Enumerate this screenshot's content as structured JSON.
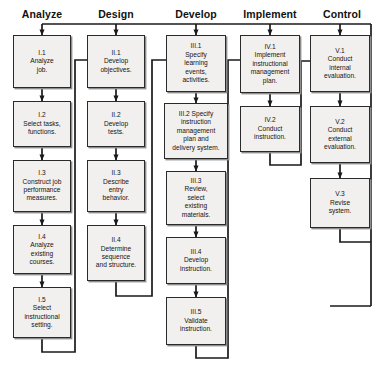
{
  "diagram": {
    "type": "flowchart",
    "orientation": "columns-top-to-bottom",
    "colors": {
      "box_fill": "#f1f0ee",
      "box_border": "#2a2a2a",
      "box_shadow": "#8e8e8e",
      "line": "#1a1a1a",
      "text": "#141414",
      "background": "#ffffff"
    },
    "phases": [
      {
        "id": "phase-analyze",
        "label": "Analyze",
        "numeral": "I",
        "steps": [
          {
            "id": "I.1",
            "number": "I.1",
            "text": "Analyze\njob."
          },
          {
            "id": "I.2",
            "number": "I.2",
            "text": "Select tasks,\nfunctions."
          },
          {
            "id": "I.3",
            "number": "I.3",
            "text": "Construct job\nperformance\nmeasures."
          },
          {
            "id": "I.4",
            "number": "I.4",
            "text": "Analyze\nexisting\ncourses."
          },
          {
            "id": "I.5",
            "number": "I.5",
            "text": "Select\ninstructional\nsetting."
          }
        ]
      },
      {
        "id": "phase-design",
        "label": "Design",
        "numeral": "II",
        "steps": [
          {
            "id": "II.1",
            "number": "II.1",
            "text": "Develop\nobjectives."
          },
          {
            "id": "II.2",
            "number": "II.2",
            "text": "Develop\ntests."
          },
          {
            "id": "II.3",
            "number": "II.3",
            "text": "Describe\nentry\nbehavior."
          },
          {
            "id": "II.4",
            "number": "II.4",
            "text": "Determine\nsequence\nand structure."
          }
        ]
      },
      {
        "id": "phase-develop",
        "label": "Develop",
        "numeral": "III",
        "steps": [
          {
            "id": "III.1",
            "number": "III.1",
            "text": "Specify\nlearning\nevents,\nactivities."
          },
          {
            "id": "III.2",
            "number": "III.2 Specify",
            "text": "instruction\nmanagement\nplan and\ndelivery system."
          },
          {
            "id": "III.3",
            "number": "III.3",
            "text": "Review,\nselect\nexisting\nmaterials."
          },
          {
            "id": "III.4",
            "number": "III.4",
            "text": "Develop\ninstruction."
          },
          {
            "id": "III.5",
            "number": "III.5",
            "text": "Validate\ninstruction."
          }
        ]
      },
      {
        "id": "phase-implement",
        "label": "Implement",
        "numeral": "IV",
        "steps": [
          {
            "id": "IV.1",
            "number": "IV.1",
            "text": "Implement\ninstructional\nmanagement\nplan."
          },
          {
            "id": "IV.2",
            "number": "IV.2",
            "text": "Conduct\ninstruction."
          }
        ]
      },
      {
        "id": "phase-control",
        "label": "Control",
        "numeral": "V",
        "steps": [
          {
            "id": "V.1",
            "number": "V.1",
            "text": "Conduct\ninternal\nevaluation."
          },
          {
            "id": "V.2",
            "number": "V.2",
            "text": "Conduct\nexternal\nevaluation."
          },
          {
            "id": "V.3",
            "number": "V.3",
            "text": "Revise\nsystem."
          }
        ]
      }
    ]
  },
  "nodes": {
    "I.1": {
      "number": "I.1",
      "text": "Analyze\njob."
    },
    "I.2": {
      "number": "I.2",
      "text": "Select tasks,\nfunctions."
    },
    "I.3": {
      "number": "I.3",
      "text": "Construct job\nperformance\nmeasures."
    },
    "I.4": {
      "number": "I.4",
      "text": "Analyze\nexisting\ncourses."
    },
    "I.5": {
      "number": "I.5",
      "text": "Select\ninstructional\nsetting."
    },
    "II.1": {
      "number": "II.1",
      "text": "Develop\nobjectives."
    },
    "II.2": {
      "number": "II.2",
      "text": "Develop\ntests."
    },
    "II.3": {
      "number": "II.3",
      "text": "Describe\nentry\nbehavior."
    },
    "II.4": {
      "number": "II.4",
      "text": "Determine\nsequence\nand structure."
    },
    "III.1": {
      "number": "III.1",
      "text": "Specify\nlearning\nevents,\nactivities."
    },
    "III.2": {
      "number": "III.2 Specify",
      "text": "instruction\nmanagement\nplan and\ndelivery system."
    },
    "III.3": {
      "number": "III.3",
      "text": "Review,\nselect\nexisting\nmaterials."
    },
    "III.4": {
      "number": "III.4",
      "text": "Develop\ninstruction."
    },
    "III.5": {
      "number": "III.5",
      "text": "Validate\ninstruction."
    },
    "IV.1": {
      "number": "IV.1",
      "text": "Implement\ninstructional\nmanagement\nplan."
    },
    "IV.2": {
      "number": "IV.2",
      "text": "Conduct\ninstruction."
    },
    "V.1": {
      "number": "V.1",
      "text": "Conduct\ninternal\nevaluation."
    },
    "V.2": {
      "number": "V.2",
      "text": "Conduct\nexternal\nevaluation."
    },
    "V.3": {
      "number": "V.3",
      "text": "Revise\nsystem."
    }
  },
  "headers": {
    "analyze": "Analyze",
    "design": "Design",
    "develop": "Develop",
    "implement": "Implement",
    "control": "Control"
  }
}
